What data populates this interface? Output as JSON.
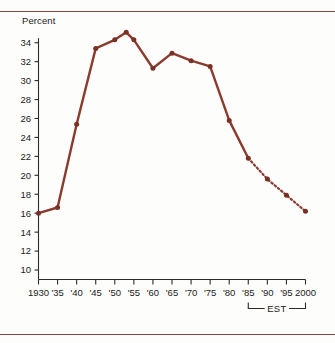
{
  "chart_data": {
    "type": "line",
    "title": "",
    "xlabel": "",
    "ylabel": "Percent",
    "ylim": [
      9,
      35.5
    ],
    "yticks": [
      10,
      12,
      14,
      16,
      18,
      20,
      22,
      24,
      26,
      28,
      30,
      32,
      34
    ],
    "ytick_labels": [
      "10",
      "12",
      "14",
      "16",
      "18",
      "20",
      "22",
      "24",
      "26",
      "28",
      "30",
      "32",
      "34"
    ],
    "grid": false,
    "legend": "none",
    "x": [
      1930,
      1935,
      1940,
      1945,
      1950,
      1955,
      1960,
      1965,
      1970,
      1975,
      1980,
      1985,
      1990,
      1995,
      2000
    ],
    "xtick_labels": [
      "1930",
      "'35",
      "'40",
      "'45",
      "'50",
      "'55",
      "'60",
      "'65",
      "'70",
      "'75",
      "'80",
      "'85",
      "'90",
      "'95",
      "2000"
    ],
    "values": [
      16.0,
      16.6,
      25.4,
      33.4,
      34.3,
      34.3,
      31.3,
      32.9,
      32.1,
      31.5,
      25.8,
      21.8,
      19.6,
      17.9,
      16.2
    ],
    "peak_between_1950_and_1955": 35.1,
    "series": [
      {
        "name": "Actual",
        "style": "solid",
        "x": [
          1930,
          1935,
          1940,
          1945,
          1950,
          1953,
          1955,
          1960,
          1965,
          1970,
          1975,
          1980,
          1985
        ],
        "values": [
          16.0,
          16.6,
          25.4,
          33.4,
          34.3,
          35.1,
          34.3,
          31.3,
          32.9,
          32.1,
          31.5,
          25.8,
          21.8
        ]
      },
      {
        "name": "Estimated",
        "style": "dashed",
        "x": [
          1985,
          1990,
          1995,
          2000
        ],
        "values": [
          21.8,
          19.6,
          17.9,
          16.2
        ]
      }
    ],
    "annotations": [
      {
        "text": "EST",
        "type": "bracket",
        "x_start": 1985,
        "x_end": 2000,
        "position": "below-axis"
      }
    ],
    "colors": {
      "line": "#8B3A2E",
      "marker": "#7A3125",
      "axis": "#2b2b2b",
      "rule": "#7d4a40",
      "background": "#fdfdfc"
    }
  },
  "axis_title": "Percent",
  "est_annotation": "EST"
}
